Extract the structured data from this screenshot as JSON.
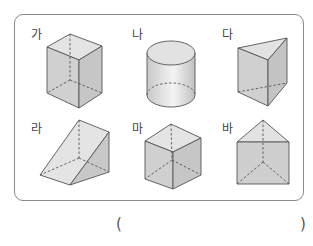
{
  "question": {
    "shapes": [
      {
        "label": "가",
        "type": "rectangular-prism"
      },
      {
        "label": "나",
        "type": "cylinder"
      },
      {
        "label": "다",
        "type": "triangular-prism"
      },
      {
        "label": "라",
        "type": "triangular-prism-wedge"
      },
      {
        "label": "마",
        "type": "cube"
      },
      {
        "label": "바",
        "type": "triangular-prism"
      }
    ],
    "answer_open": "(",
    "answer_close": ")"
  },
  "colors": {
    "border": "#8a8a8a",
    "edge": "#555555",
    "face_light": "#e6e6e6",
    "face_mid": "#d2d2d2",
    "face_dark": "#c4c4c4"
  }
}
